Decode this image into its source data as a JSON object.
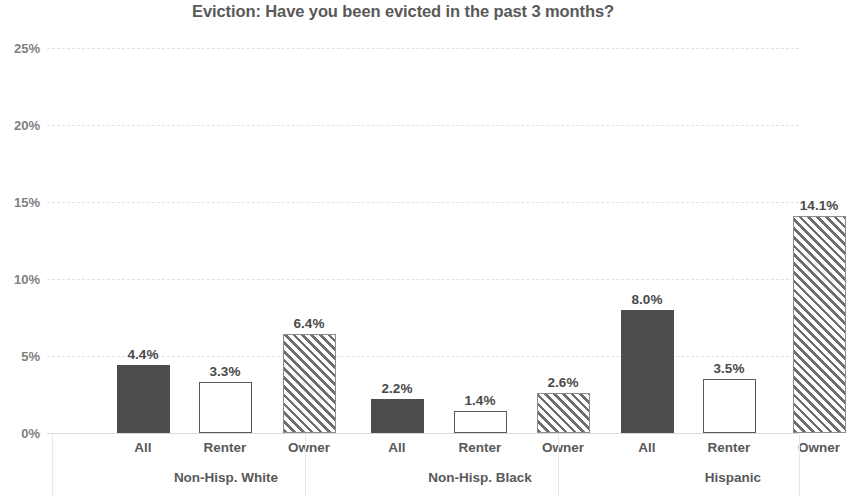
{
  "chart_data": {
    "type": "bar",
    "title": "Eviction: Have you been evicted in the past 3 months?",
    "xlabel": "",
    "ylabel": "",
    "ylim": [
      0,
      25
    ],
    "ytick_labels": [
      "0%",
      "5%",
      "10%",
      "15%",
      "20%",
      "25%"
    ],
    "ytick_values": [
      0,
      5,
      10,
      15,
      20,
      25
    ],
    "grid": true,
    "legend_position": "none",
    "categories": [
      "All",
      "Renter",
      "Owner",
      "All",
      "Renter",
      "Owner",
      "All",
      "Renter",
      "Owner"
    ],
    "groups": [
      {
        "label": "Non-Hisp. White",
        "categories": [
          "All",
          "Renter",
          "Owner"
        ],
        "values": [
          4.4,
          3.3,
          6.4
        ]
      },
      {
        "label": "Non-Hisp. Black",
        "categories": [
          "All",
          "Renter",
          "Owner"
        ],
        "values": [
          2.2,
          1.4,
          2.6
        ]
      },
      {
        "label": "Hispanic",
        "categories": [
          "All",
          "Renter",
          "Owner"
        ],
        "values": [
          8.0,
          3.5,
          14.1
        ]
      }
    ],
    "values": [
      4.4,
      3.3,
      6.4,
      2.2,
      1.4,
      2.6,
      8.0,
      3.5,
      14.1
    ],
    "data_labels": [
      "4.4%",
      "3.3%",
      "6.4%",
      "2.2%",
      "1.4%",
      "2.6%",
      "8.0%",
      "3.5%",
      "14.1%"
    ],
    "bar_styles": [
      "solid",
      "hollow",
      "hatch",
      "solid",
      "hollow",
      "hatch",
      "solid",
      "hollow",
      "hatch"
    ],
    "colors": {
      "solid_fill": "#4d4d4d",
      "hollow_fill": "#ffffff",
      "hollow_border": "#595959",
      "hatch_line": "#6e6e6e",
      "gridline": "#e2e2e2",
      "text": "#595959"
    }
  }
}
